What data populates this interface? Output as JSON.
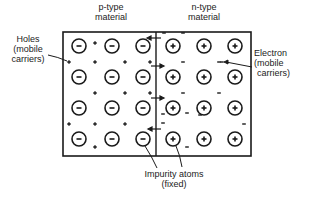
{
  "diagram": {
    "title_p": [
      "p-type",
      "material"
    ],
    "title_n": [
      "n-type",
      "material"
    ],
    "holes_label": [
      "Holes",
      "(mobile",
      "carriers)"
    ],
    "electron_label": [
      "Electron",
      "(mobile",
      "carriers)"
    ],
    "impurity_label": [
      "Impurity atoms",
      "(fixed)"
    ],
    "p_region": {
      "ion_symbol": "−",
      "carrier_symbol": "+",
      "ions": [
        [
          79,
          46
        ],
        [
          112,
          46
        ],
        [
          143,
          46
        ],
        [
          79,
          77
        ],
        [
          112,
          77
        ],
        [
          143,
          77
        ],
        [
          79,
          108
        ],
        [
          112,
          108
        ],
        [
          143,
          108
        ],
        [
          79,
          139
        ],
        [
          112,
          139
        ],
        [
          143,
          139
        ]
      ],
      "carriers": [
        [
          95,
          43
        ],
        [
          69,
          62
        ],
        [
          95,
          62
        ],
        [
          125,
          62
        ],
        [
          150,
          62
        ],
        [
          95,
          93
        ],
        [
          125,
          93
        ],
        [
          150,
          93
        ],
        [
          69,
          124
        ],
        [
          95,
          124
        ],
        [
          125,
          124
        ],
        [
          95,
          147
        ]
      ]
    },
    "n_region": {
      "ion_symbol": "+",
      "carrier_symbol": "−",
      "ions": [
        [
          173,
          46
        ],
        [
          204,
          46
        ],
        [
          235,
          46
        ],
        [
          173,
          77
        ],
        [
          204,
          77
        ],
        [
          235,
          77
        ],
        [
          173,
          108
        ],
        [
          204,
          108
        ],
        [
          235,
          108
        ],
        [
          173,
          139
        ],
        [
          204,
          139
        ],
        [
          235,
          139
        ]
      ],
      "carriers": [
        [
          164,
          33
        ],
        [
          183,
          33
        ],
        [
          219,
          62
        ],
        [
          222,
          62
        ],
        [
          183,
          62
        ],
        [
          183,
          93
        ],
        [
          219,
          93
        ],
        [
          163,
          123
        ],
        [
          187,
          113
        ],
        [
          244,
          124
        ],
        [
          200,
          115
        ],
        [
          187,
          147
        ],
        [
          163,
          114
        ]
      ]
    },
    "colors": {
      "stroke": "#1a1a1a",
      "background": "#ffffff"
    }
  }
}
